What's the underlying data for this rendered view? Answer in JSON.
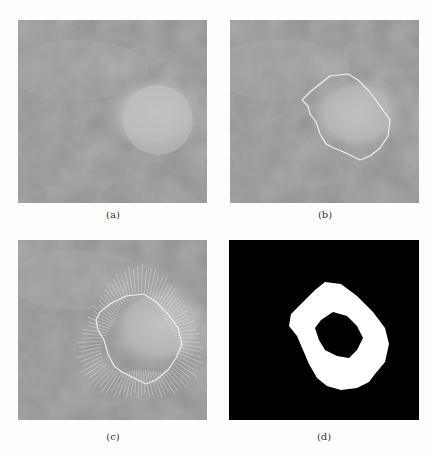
{
  "figure": {
    "panels": [
      {
        "id": "a",
        "label": "(a)",
        "content": "original mammogram region with bright mass"
      },
      {
        "id": "b",
        "label": "(b)",
        "content": "mass with segmented contour"
      },
      {
        "id": "c",
        "label": "(c)",
        "content": "contour with radial normal lines"
      },
      {
        "id": "d",
        "label": "(d)",
        "content": "binary ring mask (black background, white ring)"
      }
    ],
    "colors": {
      "background": "#fdfdfd",
      "image_gray": "#8e8e8e",
      "contour": "#f2f2f2",
      "mask_bg": "#000000",
      "mask_fg": "#ffffff"
    }
  }
}
